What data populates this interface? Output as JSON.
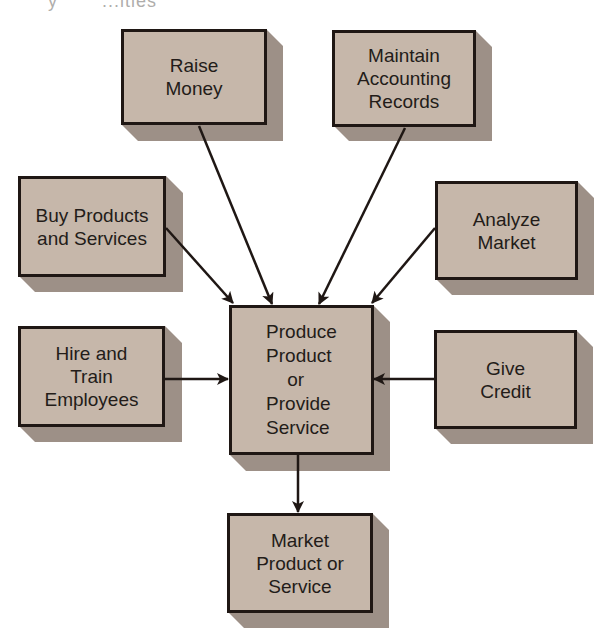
{
  "title_fragment": {
    "left": "y",
    "right": "...ities"
  },
  "diagram": {
    "type": "flow",
    "colors": {
      "box_fill": "#c6b7aa",
      "box_border": "#1f1714",
      "box_shadow": "#9d9087",
      "arrow": "#1f1714",
      "background": "#ffffff"
    },
    "nodes": {
      "raise_money": {
        "label": "Raise\nMoney"
      },
      "maintain_records": {
        "label": "Maintain\nAccounting\nRecords"
      },
      "buy_products": {
        "label": "Buy Products\nand Services"
      },
      "analyze_market": {
        "label": "Analyze\nMarket"
      },
      "hire_train": {
        "label": "Hire and\nTrain\nEmployees"
      },
      "produce": {
        "label": "Produce\nProduct\n    or\nProvide\nService"
      },
      "give_credit": {
        "label": "Give\nCredit"
      },
      "market_product": {
        "label": "Market\nProduct or\nService"
      }
    },
    "edges": [
      {
        "from": "raise_money",
        "to": "produce"
      },
      {
        "from": "maintain_records",
        "to": "produce"
      },
      {
        "from": "buy_products",
        "to": "produce"
      },
      {
        "from": "analyze_market",
        "to": "produce"
      },
      {
        "from": "hire_train",
        "to": "produce"
      },
      {
        "from": "give_credit",
        "to": "produce"
      },
      {
        "from": "produce",
        "to": "market_product"
      }
    ]
  }
}
